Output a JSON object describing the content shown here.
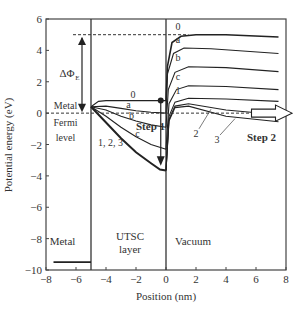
{
  "chart_data": {
    "type": "line",
    "title": "",
    "xlabel": "Position (nm)",
    "ylabel": "Potential energy (eV)",
    "xlim": [
      -8,
      8
    ],
    "ylim": [
      -10,
      6
    ],
    "xticks": [
      -8,
      -6,
      -4,
      -2,
      0,
      2,
      4,
      6,
      8
    ],
    "yticks": [
      -10,
      -8,
      -6,
      -4,
      -2,
      0,
      2,
      4,
      6
    ],
    "grid": false,
    "regions": [
      {
        "label": "Metal",
        "x": -6.9,
        "y": -8.4
      },
      {
        "label": "UTSC",
        "x": -2.4,
        "y": -8.1
      },
      {
        "label": "layer",
        "x": -2.4,
        "y": -8.9
      },
      {
        "label": "Vacuum",
        "x": 0.6,
        "y": -8.4
      }
    ],
    "boundaries": [
      -5,
      0
    ],
    "fermi_level": 0,
    "vacuum_level_line": 5,
    "metal_band_level": -9.5,
    "annotations": {
      "delta_phi": "ΔΦ",
      "delta_phi_sub": "E",
      "metal_fermi": [
        "Metal",
        "Fermi",
        "level"
      ],
      "step1": "Step 1",
      "step2": "Step 2",
      "label_123": "1, 2, 3"
    },
    "series": [
      {
        "name": "0",
        "utsc": [
          [
            -5,
            0.4
          ],
          [
            -4.5,
            0.75
          ],
          [
            -4,
            0.8
          ],
          [
            -2,
            0.8
          ],
          [
            0,
            0.8
          ]
        ],
        "vac": [
          [
            0,
            0.8
          ],
          [
            0.1,
            3
          ],
          [
            0.4,
            4.5
          ],
          [
            1,
            4.9
          ],
          [
            2,
            5
          ],
          [
            4,
            5
          ],
          [
            7.5,
            4.85
          ]
        ],
        "label_x": 0.8,
        "label_y": 5.3
      },
      {
        "name": "a",
        "utsc": [
          [
            -5,
            0.4
          ],
          [
            -4,
            0.45
          ],
          [
            -3,
            0.3
          ],
          [
            -2,
            0.15
          ],
          [
            -1,
            0.05
          ],
          [
            0,
            0.0
          ]
        ],
        "vac": [
          [
            0,
            0.0
          ],
          [
            0.1,
            2.5
          ],
          [
            0.5,
            3.8
          ],
          [
            1.2,
            4.15
          ],
          [
            3,
            4.1
          ],
          [
            7.5,
            3.8
          ]
        ],
        "label_x": 0.8,
        "label_y": 4.5
      },
      {
        "name": "b",
        "utsc": [
          [
            -5,
            0.4
          ],
          [
            -4,
            0.2
          ],
          [
            -3,
            -0.2
          ],
          [
            -2,
            -0.5
          ],
          [
            -1,
            -0.75
          ],
          [
            0,
            -0.9
          ]
        ],
        "vac": [
          [
            0,
            -0.9
          ],
          [
            0.15,
            1.5
          ],
          [
            0.6,
            2.6
          ],
          [
            1.5,
            2.95
          ],
          [
            4,
            2.9
          ],
          [
            7.5,
            2.65
          ]
        ],
        "label_x": 0.8,
        "label_y": 3.3
      },
      {
        "name": "c",
        "utsc": [
          [
            -5,
            0.4
          ],
          [
            -4,
            -0.2
          ],
          [
            -3,
            -0.9
          ],
          [
            -2,
            -1.5
          ],
          [
            -1,
            -2.0
          ],
          [
            0,
            -2.3
          ]
        ],
        "vac": [
          [
            0,
            -2.3
          ],
          [
            0.2,
            0.6
          ],
          [
            0.7,
            1.5
          ],
          [
            1.5,
            1.75
          ],
          [
            4,
            1.7
          ],
          [
            7.5,
            1.5
          ]
        ],
        "label_x": 0.8,
        "label_y": 2.1
      },
      {
        "name": "1",
        "utsc": [
          [
            -5,
            0.4
          ],
          [
            -4,
            -0.6
          ],
          [
            -3,
            -1.6
          ],
          [
            -2,
            -2.5
          ],
          [
            -1,
            -3.2
          ],
          [
            -0.4,
            -3.6
          ],
          [
            0,
            -3.65
          ]
        ],
        "vac": [
          [
            0,
            -3.65
          ],
          [
            0.2,
            -0.2
          ],
          [
            0.6,
            0.7
          ],
          [
            1.5,
            0.95
          ],
          [
            4,
            0.9
          ],
          [
            7.5,
            0.75
          ]
        ],
        "label_x": 0.8,
        "label_y": 1.2
      },
      {
        "name": "2",
        "utsc": [],
        "vac": [
          [
            0,
            -3.65
          ],
          [
            0.2,
            -0.4
          ],
          [
            0.6,
            0.45
          ],
          [
            1.5,
            0.6
          ],
          [
            4,
            0.2
          ],
          [
            7.5,
            -0.1
          ]
        ],
        "label_x": 2.0,
        "label_y": -1.5
      },
      {
        "name": "3",
        "utsc": [],
        "vac": [
          [
            0,
            -3.65
          ],
          [
            0.2,
            -0.5
          ],
          [
            0.6,
            0.35
          ],
          [
            1.5,
            0.45
          ],
          [
            4,
            -0.2
          ],
          [
            7.5,
            -0.55
          ]
        ],
        "label_x": 3.4,
        "label_y": -1.9
      }
    ],
    "legend": {
      "position": "none"
    }
  }
}
